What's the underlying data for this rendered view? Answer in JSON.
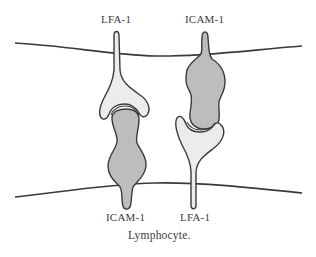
{
  "diagram": {
    "labels": {
      "top_left": "LFA-1",
      "top_right": "ICAM-1",
      "bottom_left": "ICAM-1",
      "bottom_right": "LFA-1"
    },
    "caption": "Lymphocyte.",
    "colors": {
      "membrane": "#3a3a3a",
      "outline": "#3a3a3a",
      "lfa1_fill": "#ececec",
      "icam1_fill": "#bdbdbd",
      "background": "#ffffff",
      "text": "#3a3a3a"
    }
  }
}
